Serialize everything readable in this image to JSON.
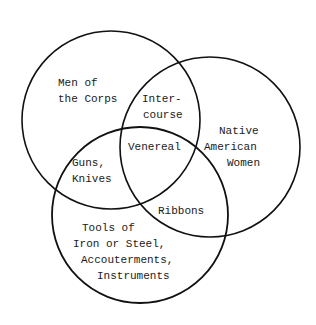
{
  "diagram": {
    "type": "venn",
    "stroke_color": "#111111",
    "text_color": "#1a1a1a",
    "sets": [
      {
        "id": "corps",
        "label_lines": [
          "Men of",
          "the Corps"
        ],
        "cx": 111,
        "cy": 120,
        "r": 89
      },
      {
        "id": "women",
        "label_lines": [
          "Native",
          "American",
          "Women"
        ],
        "cx": 210,
        "cy": 147,
        "r": 90
      },
      {
        "id": "tools",
        "label_lines": [
          "Tools of",
          "Iron or Steel,",
          "Accouterments,",
          "Instruments"
        ],
        "cx": 140,
        "cy": 215,
        "r": 88
      }
    ],
    "intersections": [
      {
        "sets": [
          "corps",
          "women"
        ],
        "label_lines": [
          "Inter-",
          "course"
        ]
      },
      {
        "sets": [
          "corps",
          "women",
          "tools"
        ],
        "label_lines": [
          "Venereal"
        ]
      },
      {
        "sets": [
          "corps",
          "tools"
        ],
        "label_lines": [
          "Guns,",
          "Knives"
        ]
      },
      {
        "sets": [
          "women",
          "tools"
        ],
        "label_lines": [
          "Ribbons"
        ]
      }
    ]
  }
}
